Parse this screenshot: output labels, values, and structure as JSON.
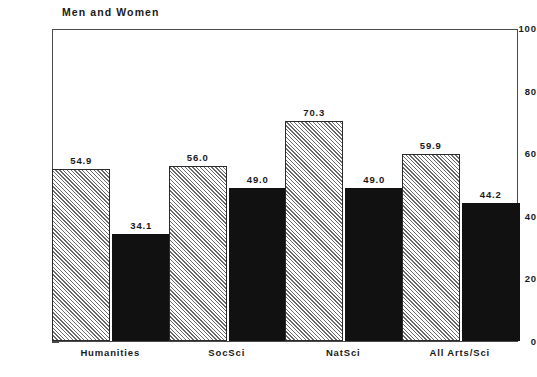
{
  "chart_data": {
    "type": "bar",
    "title": "Men and Women",
    "xlabel": "",
    "ylabel": "Percent",
    "ylim": [
      0,
      100
    ],
    "yticks": [
      "0",
      "20",
      "40",
      "60",
      "80",
      "100"
    ],
    "grid": false,
    "legend_position": "top-center",
    "categories": [
      "Humanities",
      "SocSci",
      "NatSci",
      "All Arts/Sci"
    ],
    "series": [
      {
        "name": "Research I",
        "fill": "hatched-light-gray",
        "color": "#d2d2d2",
        "values": [
          54.9,
          56.0,
          70.3,
          59.9
        ],
        "labels": [
          "54.9",
          "56.0",
          "70.3",
          "59.9"
        ]
      },
      {
        "name": "Other Res./Doct.",
        "fill": "solid-black",
        "color": "#111111",
        "values": [
          34.1,
          49.0,
          49.0,
          44.2
        ],
        "labels": [
          "34.1",
          "49.0",
          "49.0",
          "44.2"
        ]
      }
    ]
  },
  "legend": {
    "items": [
      {
        "label": "Research I",
        "swatch": "hatch-swatch-icon"
      },
      {
        "label": "Other Res./Doct.",
        "swatch": "solid-swatch-icon"
      }
    ]
  },
  "axis": {
    "y_label": "Percent",
    "y_ticks": [
      "100",
      "80",
      "60",
      "40",
      "20",
      "0"
    ],
    "x_ticks": [
      "Humanities",
      "SocSci",
      "NatSci",
      "All Arts/Sci"
    ]
  }
}
